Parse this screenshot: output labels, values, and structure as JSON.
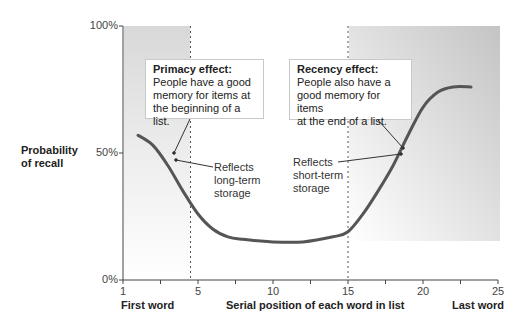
{
  "chart_data": {
    "type": "line",
    "title": "",
    "xlabel": "Serial position of each word in list",
    "ylabel": "Probability of recall",
    "xlim": [
      0,
      25
    ],
    "ylim": [
      0,
      100
    ],
    "x_ticks": [
      {
        "value": 0,
        "label": "1"
      },
      {
        "value": 2.5,
        "label": ""
      },
      {
        "value": 5,
        "label": "5"
      },
      {
        "value": 7.5,
        "label": ""
      },
      {
        "value": 10,
        "label": "10"
      },
      {
        "value": 12.5,
        "label": ""
      },
      {
        "value": 15,
        "label": "15"
      },
      {
        "value": 17.5,
        "label": ""
      },
      {
        "value": 20,
        "label": "20"
      },
      {
        "value": 22.5,
        "label": ""
      },
      {
        "value": 25,
        "label": "25"
      }
    ],
    "y_ticks": [
      {
        "value": 0,
        "label": "0%"
      },
      {
        "value": 50,
        "label": "50%"
      },
      {
        "value": 100,
        "label": "100%"
      }
    ],
    "x_end_labels": {
      "first": "First word",
      "last": "Last word"
    },
    "grid": false,
    "legend": null,
    "series": [
      {
        "name": "Serial position curve",
        "color": "#555555",
        "x": [
          1,
          2,
          3,
          4,
          5,
          6,
          7,
          8,
          10,
          12,
          14,
          15,
          16,
          17,
          18,
          19,
          20,
          21,
          22,
          23.2
        ],
        "values": [
          57,
          53,
          45,
          35,
          26,
          20,
          17,
          16,
          15,
          15,
          17,
          19,
          26,
          35,
          45,
          57,
          68,
          74,
          76,
          76
        ]
      }
    ],
    "regions": [
      {
        "name": "primacy",
        "x_range": [
          0,
          4.5
        ],
        "color_top": "#d6d6d6",
        "color_bottom": "#ffffff"
      },
      {
        "name": "recency",
        "x_range": [
          15,
          25
        ],
        "color_top": "#c6c6c6",
        "color_bottom": "#ffffff"
      }
    ],
    "dashed_lines_x": [
      4.5,
      15
    ],
    "annotations": [
      {
        "title": "Primacy effect:",
        "lines": [
          "People have a good",
          "memory for items at",
          "the beginning of a list."
        ]
      },
      {
        "title": "Recency effect:",
        "lines": [
          "People also have a",
          "good memory for items",
          "at the end of a list."
        ]
      },
      {
        "lines": [
          "Reflects",
          "long-term",
          "storage"
        ]
      },
      {
        "lines": [
          "Reflects",
          "short-term",
          "storage"
        ]
      }
    ]
  }
}
